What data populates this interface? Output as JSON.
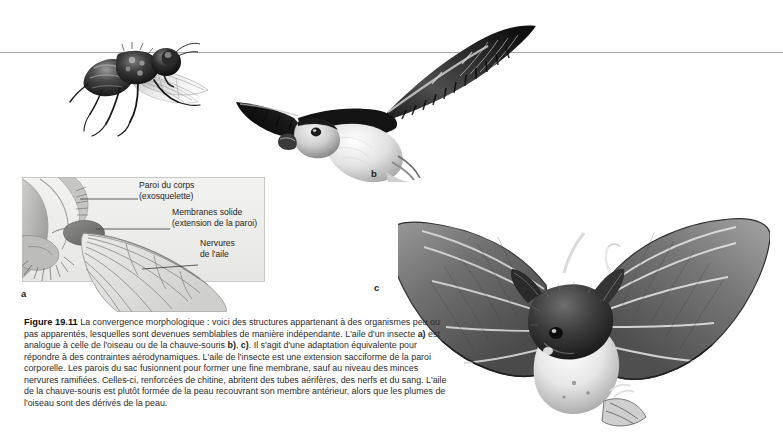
{
  "figure": {
    "number": "Figure 19.11",
    "caption_text": " La convergence morphologique : voici des structures appartenant à des organismes peu ou pas apparentés, lesquelles sont devenues semblables de manière indépendante. L'aile d'un insecte ",
    "caption_part2": " est analogue à celle de l'oiseau ou de la chauve-souris ",
    "caption_part3": ". Il s'agit d'une adaptation équivalente pour répondre à des contraintes aérodynamiques. L'aile de l'insecte est une extension sacciforme de la paroi corporelle. Les parois du sac fusionnent pour former une fine membrane, sauf au niveau des minces nervures ramifiées. Celles-ci, renforcées de chitine, abritent des tubes aérifères, des nerfs et du sang. L'aile de la chauve-souris est plutôt formée de la peau recouvrant son membre antérieur, alors que les plumes de l'oiseau sont des dérivés de la peau.",
    "marker_a": "a)",
    "marker_b": "b)",
    "marker_b_sep": ", ",
    "marker_c": "c)"
  },
  "panels": {
    "a": {
      "letter": "a",
      "subject": "insect-wing-diagram"
    },
    "b": {
      "letter": "b",
      "subject": "bird-in-flight-photo"
    },
    "c": {
      "letter": "c",
      "subject": "bat-in-flight-photo"
    }
  },
  "diagram": {
    "labels": [
      {
        "id": "paroi",
        "line1": "Paroi du corps",
        "line2": "(exosquelette)"
      },
      {
        "id": "membrane",
        "line1": "Membranes solide",
        "line2": "(extension de la paroi)"
      },
      {
        "id": "nervures",
        "line1": "Nervures",
        "line2": "de l'aile"
      }
    ]
  },
  "colors": {
    "page_background": "#ffffff",
    "text": "#231f20",
    "rule": "#a9a9a9",
    "diagram_fill": "#efefed",
    "diagram_border": "#c9c9c7",
    "leader_line": "#4a4a4a"
  }
}
